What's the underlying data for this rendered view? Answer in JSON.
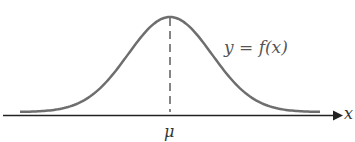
{
  "diagram": {
    "type": "normal-distribution-curve",
    "function_label": "y = f(x)",
    "mean_label": "μ",
    "axis_label": "x",
    "colors": {
      "curve": "#6e6e6e",
      "axis": "#222222",
      "dashed": "#444444"
    }
  }
}
